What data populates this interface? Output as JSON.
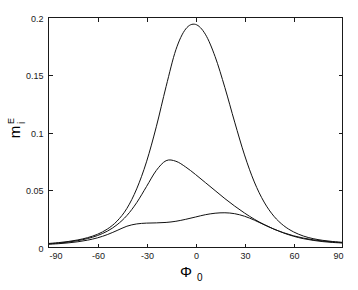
{
  "figure": {
    "background_color": "#ffffff",
    "line_color": "#111111",
    "axis_color": "#1a1a1a"
  },
  "chart_data": {
    "type": "line",
    "title": "",
    "subtitle": "",
    "xlabel": "Φ",
    "xlabel_sub": "0",
    "ylabel": "m",
    "ylabel_sub": "i",
    "ylabel_sup": "E",
    "xlim": [
      -90,
      90
    ],
    "ylim": [
      0,
      0.2
    ],
    "xticks": [
      -90,
      -60,
      -30,
      0,
      30,
      60,
      90
    ],
    "xticklabels": [
      "-90",
      "-60",
      "-30",
      "0",
      "30",
      "60",
      "90"
    ],
    "yticks": [
      0,
      0.05,
      0.1,
      0.15,
      0.2
    ],
    "yticklabels": [
      "0",
      "0.05",
      "0.1",
      "0.15",
      "0.2"
    ],
    "grid": false,
    "legend": false,
    "legend_position": "none",
    "x": [
      -90,
      -84,
      -78,
      -72,
      -66,
      -60,
      -54,
      -48,
      -42,
      -36,
      -30,
      -24,
      -18,
      -12,
      -6,
      0,
      6,
      12,
      18,
      24,
      30,
      36,
      42,
      48,
      54,
      60,
      66,
      72,
      78,
      84,
      90
    ],
    "series": [
      {
        "name": "curve-tall",
        "peak_x": -3,
        "peak_y": 0.194,
        "values": [
          0.0035,
          0.0042,
          0.0052,
          0.0066,
          0.0086,
          0.0115,
          0.016,
          0.023,
          0.034,
          0.051,
          0.0745,
          0.105,
          0.14,
          0.172,
          0.19,
          0.194,
          0.1855,
          0.166,
          0.139,
          0.109,
          0.0805,
          0.057,
          0.0395,
          0.0272,
          0.019,
          0.0136,
          0.01,
          0.0077,
          0.0062,
          0.0052,
          0.0045
        ]
      },
      {
        "name": "curve-middle",
        "peak_x": -15,
        "peak_y": 0.076,
        "values": [
          0.0032,
          0.0038,
          0.0047,
          0.006,
          0.0078,
          0.0104,
          0.0142,
          0.0198,
          0.0278,
          0.039,
          0.053,
          0.067,
          0.0755,
          0.075,
          0.07,
          0.0635,
          0.0565,
          0.0495,
          0.0425,
          0.036,
          0.03,
          0.0246,
          0.02,
          0.016,
          0.0128,
          0.0102,
          0.0082,
          0.0067,
          0.0056,
          0.0048,
          0.0042
        ]
      },
      {
        "name": "curve-flat",
        "peak_x": 18,
        "peak_y": 0.03,
        "values": [
          0.0028,
          0.0033,
          0.004,
          0.005,
          0.0064,
          0.0084,
          0.0112,
          0.0148,
          0.0185,
          0.0205,
          0.0212,
          0.0214,
          0.0218,
          0.0228,
          0.0245,
          0.0265,
          0.0285,
          0.0298,
          0.0302,
          0.0294,
          0.0272,
          0.0238,
          0.0198,
          0.016,
          0.0126,
          0.0098,
          0.0077,
          0.0062,
          0.0051,
          0.0044,
          0.0039
        ]
      }
    ]
  }
}
